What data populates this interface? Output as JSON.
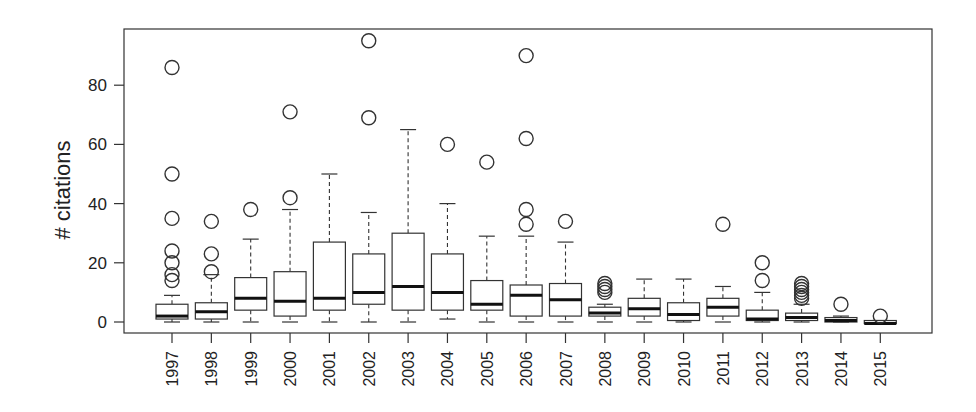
{
  "chart_data": {
    "type": "box",
    "title": "",
    "xlabel": "",
    "ylabel": "# citations",
    "ylim": [
      -4,
      98
    ],
    "yticks": [
      0,
      20,
      40,
      60,
      80
    ],
    "grid": false,
    "legend": null,
    "categories": [
      "1997",
      "1998",
      "1999",
      "2000",
      "2001",
      "2002",
      "2003",
      "2004",
      "2005",
      "2006",
      "2007",
      "2008",
      "2009",
      "2010",
      "2011",
      "2012",
      "2013",
      "2014",
      "2015"
    ],
    "boxes": [
      {
        "label": "1997",
        "whisker_low": 0,
        "q1": 1,
        "median": 2,
        "q3": 6,
        "whisker_high": 9,
        "outliers": [
          14,
          16,
          20,
          24,
          35,
          50,
          86
        ]
      },
      {
        "label": "1998",
        "whisker_low": 0,
        "q1": 1,
        "median": 3.5,
        "q3": 6.5,
        "whisker_high": 16,
        "outliers": [
          17,
          23,
          34
        ]
      },
      {
        "label": "1999",
        "whisker_low": 0,
        "q1": 4,
        "median": 8,
        "q3": 15,
        "whisker_high": 28,
        "outliers": [
          38
        ]
      },
      {
        "label": "2000",
        "whisker_low": 0,
        "q1": 2,
        "median": 7,
        "q3": 17,
        "whisker_high": 38,
        "outliers": [
          42,
          71
        ]
      },
      {
        "label": "2001",
        "whisker_low": 0,
        "q1": 4,
        "median": 8,
        "q3": 27,
        "whisker_high": 50,
        "outliers": []
      },
      {
        "label": "2002",
        "whisker_low": 0,
        "q1": 6,
        "median": 10,
        "q3": 23,
        "whisker_high": 37,
        "outliers": [
          69,
          95
        ]
      },
      {
        "label": "2003",
        "whisker_low": 0,
        "q1": 4,
        "median": 12,
        "q3": 30,
        "whisker_high": 65,
        "outliers": []
      },
      {
        "label": "2004",
        "whisker_low": 1,
        "q1": 4,
        "median": 10,
        "q3": 23,
        "whisker_high": 40,
        "outliers": [
          60
        ]
      },
      {
        "label": "2005",
        "whisker_low": 0,
        "q1": 4,
        "median": 6,
        "q3": 14,
        "whisker_high": 29,
        "outliers": [
          54
        ]
      },
      {
        "label": "2006",
        "whisker_low": 0,
        "q1": 2,
        "median": 9,
        "q3": 12.5,
        "whisker_high": 29,
        "outliers": [
          33,
          38,
          62,
          90
        ]
      },
      {
        "label": "2007",
        "whisker_low": 0,
        "q1": 2,
        "median": 7.5,
        "q3": 13,
        "whisker_high": 27,
        "outliers": [
          34
        ]
      },
      {
        "label": "2008",
        "whisker_low": 0,
        "q1": 2,
        "median": 3,
        "q3": 5,
        "whisker_high": 6,
        "outliers": [
          10,
          11,
          12,
          13
        ]
      },
      {
        "label": "2009",
        "whisker_low": 0,
        "q1": 2,
        "median": 4.5,
        "q3": 8,
        "whisker_high": 14.5,
        "outliers": []
      },
      {
        "label": "2010",
        "whisker_low": 0,
        "q1": 0.5,
        "median": 2.5,
        "q3": 6.5,
        "whisker_high": 14.5,
        "outliers": []
      },
      {
        "label": "2011",
        "whisker_low": 0,
        "q1": 2,
        "median": 5,
        "q3": 8,
        "whisker_high": 12,
        "outliers": [
          33
        ]
      },
      {
        "label": "2012",
        "whisker_low": 0,
        "q1": 0.5,
        "median": 1,
        "q3": 4,
        "whisker_high": 10,
        "outliers": [
          14,
          20
        ]
      },
      {
        "label": "2013",
        "whisker_low": 0,
        "q1": 0.5,
        "median": 1.5,
        "q3": 3,
        "whisker_high": 6,
        "outliers": [
          8,
          9,
          10,
          11,
          12,
          13
        ]
      },
      {
        "label": "2014",
        "whisker_low": 0,
        "q1": 0,
        "median": 0.5,
        "q3": 1.5,
        "whisker_high": 2,
        "outliers": [
          6
        ]
      },
      {
        "label": "2015",
        "whisker_low": -0.5,
        "q1": -0.5,
        "median": -0.5,
        "q3": 0.5,
        "whisker_high": 0.5,
        "outliers": [
          2
        ]
      }
    ]
  },
  "axes": {
    "ylabel": "# citations",
    "ytick_labels": [
      "0",
      "20",
      "40",
      "60",
      "80"
    ]
  }
}
